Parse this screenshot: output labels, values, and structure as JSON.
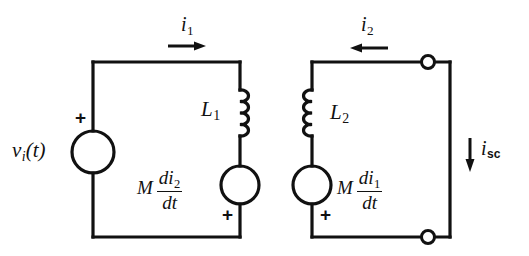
{
  "figure": {
    "type": "electrical-circuit-schematic",
    "stroke_color": "#111111",
    "background_color": "#ffffff"
  },
  "source": {
    "label_main": "v",
    "label_sub": "i",
    "label_tail": "(t)",
    "polarity": "+",
    "name": "independent-voltage-source"
  },
  "left_loop": {
    "inductor": {
      "label_main": "L",
      "label_sub": "1"
    },
    "dependent_source": {
      "coefficient": "M",
      "numerator_main": "di",
      "numerator_sub": "2",
      "denominator": "dt",
      "polarity": "+"
    },
    "current": {
      "label_main": "i",
      "label_sub": "1",
      "arrow_direction": "right"
    }
  },
  "right_loop": {
    "inductor": {
      "label_main": "L",
      "label_sub": "2"
    },
    "dependent_source": {
      "coefficient": "M",
      "numerator_main": "di",
      "numerator_sub": "1",
      "denominator": "dt",
      "polarity": "+"
    },
    "current": {
      "label_main": "i",
      "label_sub": "2",
      "arrow_direction": "left"
    }
  },
  "output": {
    "current": {
      "label_main": "i",
      "label_sub": "sc",
      "arrow_direction": "down"
    },
    "terminals": [
      "open-terminal-top",
      "open-terminal-bottom"
    ]
  }
}
